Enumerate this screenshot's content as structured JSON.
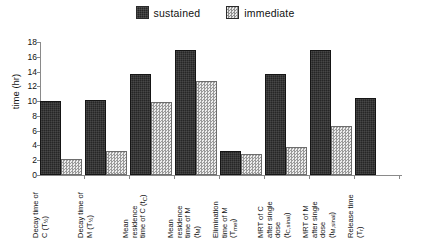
{
  "legend": {
    "position": "top-center",
    "entries": [
      {
        "label": "sustained",
        "swatch": "dark-solid-square-icon",
        "color": "#262626"
      },
      {
        "label": "immediate",
        "swatch": "light-checker-square-icon",
        "color": "#cfcfcf"
      }
    ]
  },
  "axis": {
    "ylabel": "time (hr)",
    "ytick_labels": [
      "18",
      "16",
      "14",
      "12",
      "10",
      "8",
      "6",
      "4",
      "2",
      "0"
    ]
  },
  "chart_data": {
    "type": "bar",
    "title": "",
    "xlabel": "",
    "ylabel": "time (hr)",
    "ylim": [
      0,
      18
    ],
    "ytick_step": 2,
    "grid": false,
    "legend_position": "top-center",
    "categories": [
      "Decay time of C (T½)",
      "Decay time of M (T½)",
      "Mean residence time of C (t̄C)",
      "Mean residence time of M (t̄M)",
      "Elimination time of M (Tmel)",
      "MRT of C after single dose (t̄C,sinal)",
      "MRT of M after single dose (t̄M,sinal)",
      "Release time (Tr)"
    ],
    "categories_display": [
      {
        "line1": "Decay time of",
        "line2": "C (T",
        "sub": "½",
        "close": ")"
      },
      {
        "line1": "Decay time of",
        "line2": "M (T",
        "sub": "½",
        "close": ")"
      },
      {
        "line1": "Mean",
        "line2": "residence",
        "line3": "time of C (t",
        "sub": "C",
        "close": ")"
      },
      {
        "line1": "Mean",
        "line2": "residence",
        "line3": "time of M",
        "line4": "(t",
        "sub": "M",
        "close": ")"
      },
      {
        "line1": "Elimination",
        "line2": "time of M",
        "line3": "(T",
        "sub": "mel",
        "close": ")"
      },
      {
        "line1": "MRT of C",
        "line2": "after single",
        "line3": "dose",
        "line4": "(t",
        "sub": "C,sinal",
        "close": ")"
      },
      {
        "line1": "MRT of M",
        "line2": "after single",
        "line3": "dose",
        "line4": "(t",
        "sub": "M,sinal",
        "close": ")"
      },
      {
        "line1": "Release time",
        "line2": "(T",
        "sub": "r",
        "close": ")"
      }
    ],
    "series": [
      {
        "name": "sustained",
        "color": "#262626",
        "values": [
          10.0,
          10.1,
          13.7,
          16.9,
          3.2,
          13.7,
          16.9,
          10.4
        ]
      },
      {
        "name": "immediate",
        "color": "#cfcfcf",
        "values": [
          2.2,
          3.2,
          9.9,
          12.7,
          2.9,
          3.8,
          6.7,
          null
        ]
      }
    ]
  }
}
